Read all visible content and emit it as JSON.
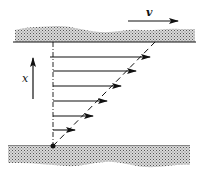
{
  "diagram": {
    "labels": {
      "velocity": "v",
      "axis": "x"
    },
    "colors": {
      "ink": "#111111",
      "plate_fill": "#bdbdbd"
    },
    "profile_arrows": [
      {
        "y": 57,
        "length": 97
      },
      {
        "y": 71,
        "length": 83
      },
      {
        "y": 86,
        "length": 68
      },
      {
        "y": 101,
        "length": 54
      },
      {
        "y": 116,
        "length": 40
      },
      {
        "y": 130,
        "length": 22
      }
    ]
  }
}
